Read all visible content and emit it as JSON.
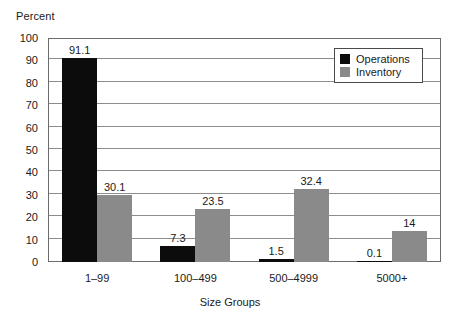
{
  "chart_data": {
    "type": "bar",
    "title": "",
    "subtitle": "",
    "xlabel": "Size Groups",
    "ylabel": "Percent",
    "categories": [
      "1–99",
      "100–499",
      "500–4999",
      "5000+"
    ],
    "series": [
      {
        "name": "Operations",
        "color": "#0c0c0c",
        "values": [
          91.1,
          7.3,
          1.5,
          0.1
        ],
        "labels": [
          "91.1",
          "7.3",
          "1.5",
          "0.1"
        ]
      },
      {
        "name": "Inventory",
        "color": "#8a8a8a",
        "values": [
          30.1,
          23.5,
          32.4,
          14
        ],
        "labels": [
          "30.1",
          "23.5",
          "32.4",
          "14"
        ]
      }
    ],
    "ylim": [
      0,
      100
    ],
    "yticks": [
      0,
      10,
      20,
      30,
      40,
      50,
      60,
      70,
      80,
      90,
      100
    ],
    "ytick_labels": [
      "0",
      "10",
      "20",
      "30",
      "40",
      "50",
      "60",
      "70",
      "80",
      "90",
      "100"
    ],
    "grid": true,
    "grid_axis": "y",
    "legend_position": "top-right",
    "bar_layout": "grouped-adjacent"
  },
  "axes": {
    "y_title": "Percent",
    "x_title": "Size Groups"
  },
  "legend": {
    "entries": [
      {
        "label": "Operations",
        "swatch": "black-square"
      },
      {
        "label": "Inventory",
        "swatch": "gray-square"
      }
    ]
  },
  "colors": {
    "operations": "#0c0c0c",
    "inventory": "#8a8a8a",
    "gridline": "#8d8d8d",
    "frame": "#6b6b6b",
    "text": "#1a1a1a",
    "background": "#ffffff"
  }
}
